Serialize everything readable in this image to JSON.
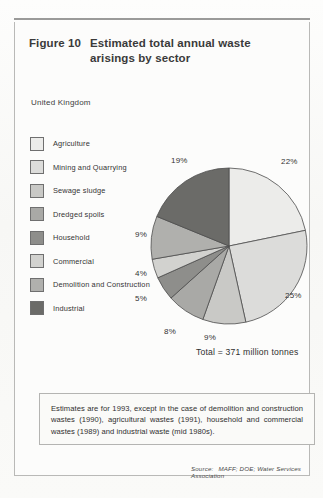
{
  "figure": {
    "label": "Figure 10",
    "title": "Estimated total annual waste arisings by sector",
    "region": "United Kingdom",
    "total": "Total = 371 million tonnes"
  },
  "legend": {
    "items": [
      {
        "label": "Agriculture",
        "color": "#ececea",
        "pct": "22%"
      },
      {
        "label": "Mining and Quarrying",
        "color": "#dcdcda",
        "pct": "25%"
      },
      {
        "label": "Sewage sludge",
        "color": "#c9c9c6",
        "pct": "9%"
      },
      {
        "label": "Dredged spoils",
        "color": "#a9a9a6",
        "pct": "8%"
      },
      {
        "label": "Household",
        "color": "#8e8e8b",
        "pct": "5%"
      },
      {
        "label": "Commercial",
        "color": "#d2d2cf",
        "pct": "4%"
      },
      {
        "label": "Demolition and Construction",
        "color": "#b0b0ad",
        "pct": "9%"
      },
      {
        "label": "Industrial",
        "color": "#6b6b68",
        "pct": "19%"
      }
    ]
  },
  "note": {
    "text": "Estimates are for 1993, except in the case of demolition and construction wastes (1990), agricultural wastes (1991), household and commercial wastes (1989) and industrial waste (mid 1980s)."
  },
  "source": {
    "label": "Source:",
    "text": "MAFF; DOE; Water Services Association"
  },
  "chart_data": {
    "type": "pie",
    "title": "Estimated total annual waste arisings by sector",
    "subtitle": "United Kingdom",
    "unit": "per cent of total waste arisings",
    "total": 371,
    "total_unit": "million tonnes",
    "total_label": "Total = 371 million tonnes",
    "start_angle_deg": 0,
    "direction": "clockwise",
    "legend_position": "left",
    "labels": [
      "Agriculture",
      "Mining and Quarrying",
      "Sewage sludge",
      "Dredged spoils",
      "Household",
      "Commercial",
      "Demolition and Construction",
      "Industrial"
    ],
    "values": [
      22,
      25,
      9,
      8,
      5,
      4,
      9,
      19
    ],
    "value_labels": [
      "22%",
      "25%",
      "9%",
      "8%",
      "5%",
      "4%",
      "9%",
      "19%"
    ],
    "colors": [
      "#ececea",
      "#dcdcda",
      "#c9c9c6",
      "#a9a9a6",
      "#8e8e8b",
      "#d2d2cf",
      "#b0b0ad",
      "#6b6b68"
    ]
  }
}
